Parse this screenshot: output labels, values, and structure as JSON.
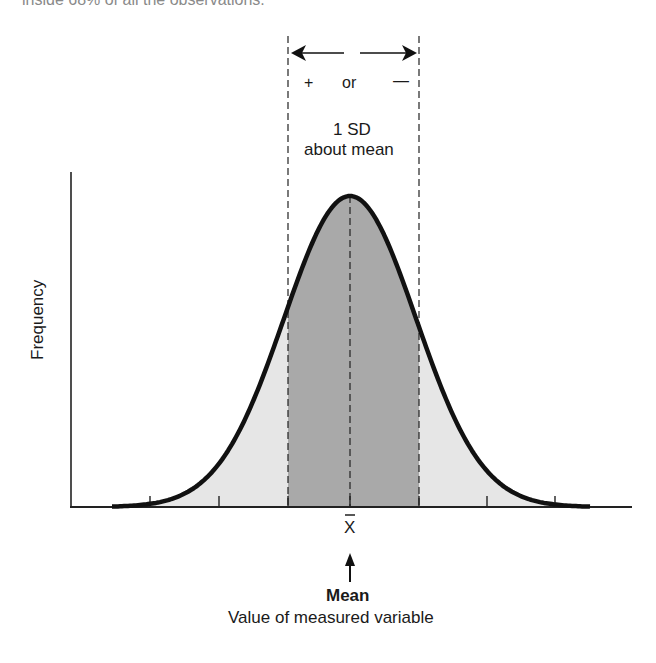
{
  "header": {
    "clipped_text": "inside 68% of all the observations."
  },
  "annotations": {
    "sign_plus": "+",
    "sign_or": "or",
    "sign_minus": "—",
    "sd_line1": "1 SD",
    "sd_line2": "about mean",
    "xbar": "X",
    "mean_label": "Mean"
  },
  "colors": {
    "curve": "#111111",
    "inner_fill": "#a9a9a9",
    "outer_fill": "#e6e6e6",
    "axis": "#222222"
  },
  "chart_data": {
    "type": "area",
    "title": "",
    "xlabel": "Value of measured variable",
    "ylabel": "Frequency",
    "distribution": "normal",
    "mean_label": "X̄ (Mean)",
    "shaded_region": "mean ± 1 SD (dark gray)",
    "outer_region": "beyond ±1 SD (light gray)",
    "x_ticks_sd": [
      -3,
      -2,
      -1,
      0,
      1,
      2,
      3
    ],
    "x_tick_labels": [
      "",
      "",
      "",
      "X̄",
      "",
      "",
      ""
    ],
    "grid": false,
    "legend": null,
    "annotations": [
      "← + or — →",
      "1 SD about mean",
      "Mean"
    ]
  }
}
